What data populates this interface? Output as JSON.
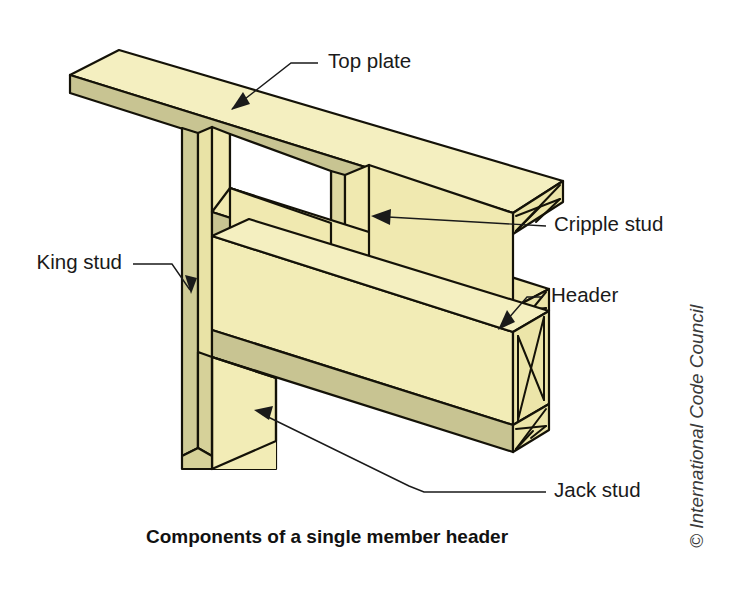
{
  "figure": {
    "caption": "Components of a single member header",
    "credit": "© International Code Council",
    "background_color": "#ffffff"
  },
  "colors": {
    "wood_face_light": "#f4efc0",
    "wood_face_mid": "#f0e9b0",
    "wood_edge_olive": "#c8c492",
    "wood_edge_dark": "#b9b483",
    "outline": "#141208",
    "label_text": "#1a1a1a",
    "caption_text": "#111111",
    "credit_text": "#3a3a3a"
  },
  "labels": [
    {
      "id": "top-plate",
      "text": "Top plate",
      "x": 328,
      "y": 63,
      "anchor": "start",
      "leader": "M 318 63 L 291 63 L 232 109",
      "arrow_points": "232,109 247,105 243,95"
    },
    {
      "id": "cripple-stud",
      "text": "Cripple stud",
      "x": 554,
      "y": 226,
      "anchor": "start",
      "leader": "M 546 226 L 388 217",
      "arrow_points": "373,216 390,210 389,224"
    },
    {
      "id": "header",
      "text": "Header",
      "x": 551,
      "y": 297,
      "anchor": "start",
      "leader": "M 543 297 L 527 297 L 499 327",
      "arrow_points": "499,327 513,321 508,312"
    },
    {
      "id": "king-stud",
      "text": "King stud",
      "x": 122,
      "y": 264,
      "anchor": "end",
      "leader": "M 133 264 L 172 264 L 190 289",
      "arrow_points": "190,292 186,277 196,279"
    },
    {
      "id": "jack-stud",
      "text": "Jack stud",
      "x": 554,
      "y": 492,
      "anchor": "start",
      "leader": "M 546 492 L 422 492 L 407 486 L 261 413",
      "arrow_points": "255,411 271,407 268,419"
    }
  ],
  "caption": {
    "text": "Components of a single member header",
    "x": 327,
    "y": 543
  },
  "credit": {
    "text": "© International Code Council",
    "x": 703,
    "y": 548
  },
  "components": [
    {
      "name": "top-plate",
      "description": "horizontal top plate board sloping down to the right"
    },
    {
      "name": "king-stud",
      "description": "full height narrow vertical stud at left edge"
    },
    {
      "name": "cripple-stud",
      "description": "short vertical stud between top plate and header"
    },
    {
      "name": "header",
      "description": "deep horizontal beam spanning the opening with X end grain"
    },
    {
      "name": "jack-stud",
      "description": "short stud under the header beside the king stud"
    }
  ]
}
